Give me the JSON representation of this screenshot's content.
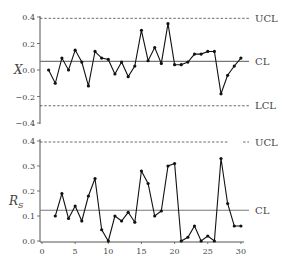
{
  "chart_data": [
    {
      "type": "line",
      "title": "",
      "ylabel": "X",
      "xlabel": "",
      "ylim": [
        -0.4,
        0.4
      ],
      "xlim": [
        0,
        30
      ],
      "yticks": [
        "0.4",
        "0.2",
        "0.0",
        "-0.2",
        "-0.4"
      ],
      "grid": false,
      "x": [
        1,
        2,
        3,
        4,
        5,
        6,
        7,
        8,
        9,
        10,
        11,
        12,
        13,
        14,
        15,
        16,
        17,
        18,
        19,
        20,
        21,
        22,
        23,
        24,
        25,
        26,
        27,
        28,
        29,
        30
      ],
      "values": [
        0.0,
        -0.1,
        0.09,
        0.0,
        0.15,
        0.06,
        -0.12,
        0.14,
        0.09,
        0.08,
        -0.03,
        0.06,
        -0.05,
        0.03,
        0.3,
        0.07,
        0.17,
        0.05,
        0.35,
        0.04,
        0.04,
        0.06,
        0.12,
        0.12,
        0.14,
        0.14,
        -0.18,
        -0.04,
        0.03,
        0.09
      ],
      "control_lines": {
        "UCL": 0.39,
        "CL": 0.065,
        "LCL": -0.27
      },
      "line_labels": [
        "UCL",
        "CL",
        "LCL"
      ]
    },
    {
      "type": "line",
      "title": "",
      "ylabel": "R_S",
      "xlabel": "",
      "ylim": [
        0.0,
        0.4
      ],
      "xlim": [
        0,
        30
      ],
      "yticks": [
        "0.4",
        "0.3",
        "0.2",
        "0.1",
        "0.0"
      ],
      "xticks": [
        "0",
        "5",
        "10",
        "15",
        "20",
        "25",
        "30"
      ],
      "grid": false,
      "x": [
        2,
        3,
        4,
        5,
        6,
        7,
        8,
        9,
        10,
        11,
        12,
        13,
        14,
        15,
        16,
        17,
        18,
        19,
        20,
        21,
        22,
        23,
        24,
        25,
        26,
        27,
        28,
        29,
        30
      ],
      "values": [
        0.1,
        0.19,
        0.09,
        0.14,
        0.08,
        0.18,
        0.25,
        0.045,
        0.0,
        0.1,
        0.08,
        0.115,
        0.075,
        0.28,
        0.23,
        0.1,
        0.12,
        0.3,
        0.31,
        0.0,
        0.015,
        0.06,
        0.0,
        0.02,
        0.0,
        0.33,
        0.15,
        0.06,
        0.06
      ],
      "control_lines": {
        "UCL": 0.4,
        "CL": 0.123
      },
      "line_labels": [
        "UCL",
        "CL"
      ]
    }
  ]
}
